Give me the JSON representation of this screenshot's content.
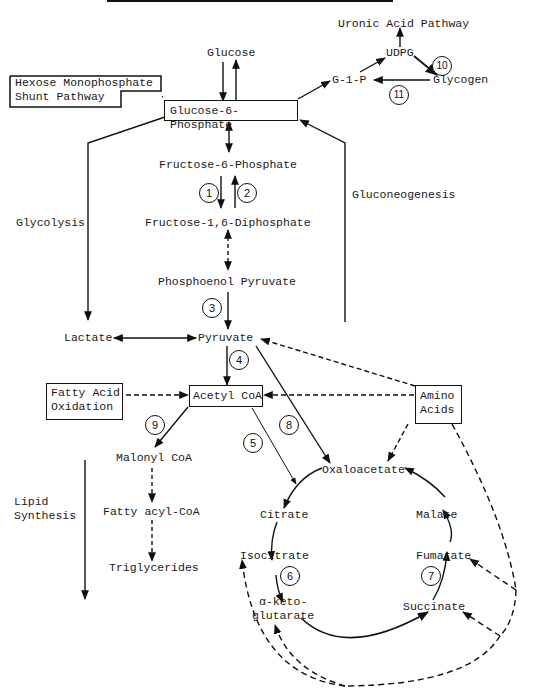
{
  "diagram": {
    "type": "metabolic-pathway",
    "colors": {
      "ink": "#111111",
      "background": "#ffffff"
    },
    "nodes": {
      "uronic_acid_pathway": "Uronic Acid Pathway",
      "glucose": "Glucose",
      "udpg": "UDPG",
      "g1p": "G-1-P",
      "glycogen": "Glycogen",
      "hmp_shunt_line1": "Hexose Monophosphate",
      "hmp_shunt_line2": "Shunt Pathway",
      "glucose_6_phosphate": "Glucose-6-Phosphate",
      "fructose_6_phosphate": "Fructose-6-Phosphate",
      "fructose_16_diphosphate": "Fructose-1,6-Diphosphate",
      "phosphoenol_pyruvate": "Phosphoenol Pyruvate",
      "lactate": "Lactate",
      "pyruvate": "Pyruvate",
      "fatty_acid_oxidation_line1": "Fatty Acid",
      "fatty_acid_oxidation_line2": "Oxidation",
      "acetyl_coa": "Acetyl CoA",
      "amino_acids_line1": "Amino",
      "amino_acids_line2": "Acids",
      "malonyl_coa": "Malonyl CoA",
      "fatty_acyl_coa": "Fatty acyl-CoA",
      "triglycerides": "Triglycerides",
      "oxaloacetate": "Oxaloacetate",
      "citrate": "Citrate",
      "isocitrate": "Isocitrate",
      "alpha_ketoglutarate_line1": "α-keto-",
      "alpha_ketoglutarate_line2": "glutarate",
      "succinate": "Succinate",
      "fumarate": "Fumarate",
      "malate": "Malate"
    },
    "pathway_labels": {
      "glycolysis": "Glycolysis",
      "gluconeogenesis": "Gluconeogenesis",
      "lipid_synthesis_line1": "Lipid",
      "lipid_synthesis_line2": "Synthesis"
    },
    "step_numbers": [
      "1",
      "2",
      "3",
      "4",
      "5",
      "6",
      "7",
      "8",
      "9",
      "10",
      "11"
    ],
    "edges": [
      {
        "from": "Glucose",
        "to": "Glucose-6-Phosphate",
        "style": "solid"
      },
      {
        "from": "Glucose-6-Phosphate",
        "to": "Glucose",
        "style": "solid"
      },
      {
        "from": "Glucose-6-Phosphate",
        "to": "Hexose Monophosphate Shunt Pathway",
        "style": "solid"
      },
      {
        "from": "Glucose-6-Phosphate",
        "to": "G-1-P",
        "style": "solid"
      },
      {
        "from": "G-1-P",
        "to": "UDPG",
        "style": "solid"
      },
      {
        "from": "UDPG",
        "to": "Uronic Acid Pathway",
        "style": "solid"
      },
      {
        "from": "UDPG",
        "to": "Glycogen",
        "style": "solid",
        "step": "10"
      },
      {
        "from": "Glycogen",
        "to": "G-1-P",
        "style": "solid",
        "step": "11"
      },
      {
        "from": "Glucose-6-Phosphate",
        "to": "Fructose-6-Phosphate",
        "style": "solid-bidirectional"
      },
      {
        "from": "Fructose-6-Phosphate",
        "to": "Fructose-1,6-Diphosphate",
        "style": "solid",
        "step": "1"
      },
      {
        "from": "Fructose-1,6-Diphosphate",
        "to": "Fructose-6-Phosphate",
        "style": "solid",
        "step": "2"
      },
      {
        "from": "Fructose-1,6-Diphosphate",
        "to": "Phosphoenol Pyruvate",
        "style": "dashed-bidirectional"
      },
      {
        "from": "Phosphoenol Pyruvate",
        "to": "Pyruvate",
        "style": "solid",
        "step": "3"
      },
      {
        "from": "Lactate",
        "to": "Pyruvate",
        "style": "solid-bidirectional"
      },
      {
        "from": "Pyruvate",
        "to": "Acetyl CoA",
        "style": "solid",
        "step": "4"
      },
      {
        "from": "Pyruvate",
        "to": "Oxaloacetate",
        "style": "solid",
        "step": "8"
      },
      {
        "from": "Fatty Acid Oxidation",
        "to": "Acetyl CoA",
        "style": "dashed"
      },
      {
        "from": "Amino Acids",
        "to": "Acetyl CoA",
        "style": "dashed"
      },
      {
        "from": "Amino Acids",
        "to": "Pyruvate",
        "style": "dashed"
      },
      {
        "from": "Amino Acids",
        "to": "Oxaloacetate",
        "style": "dashed"
      },
      {
        "from": "Acetyl CoA",
        "to": "Malonyl CoA",
        "style": "solid",
        "step": "9"
      },
      {
        "from": "Acetyl CoA",
        "to": "Citrate",
        "style": "solid",
        "step": "5"
      },
      {
        "from": "Malonyl CoA",
        "to": "Fatty acyl-CoA",
        "style": "dashed"
      },
      {
        "from": "Fatty acyl-CoA",
        "to": "Triglycerides",
        "style": "dashed"
      },
      {
        "from": "Oxaloacetate",
        "to": "Citrate",
        "style": "solid"
      },
      {
        "from": "Citrate",
        "to": "Isocitrate",
        "style": "solid"
      },
      {
        "from": "Isocitrate",
        "to": "α-ketoglutarate",
        "style": "solid",
        "step": "6"
      },
      {
        "from": "α-ketoglutarate",
        "to": "Succinate",
        "style": "solid"
      },
      {
        "from": "Succinate",
        "to": "Fumarate",
        "style": "solid",
        "step": "7"
      },
      {
        "from": "Fumarate",
        "to": "Malate",
        "style": "solid"
      },
      {
        "from": "Malate",
        "to": "Oxaloacetate",
        "style": "solid"
      },
      {
        "from": "Amino Acids",
        "to": "Fumarate",
        "style": "dashed"
      },
      {
        "from": "Amino Acids",
        "to": "Succinate",
        "style": "dashed"
      },
      {
        "from": "Amino Acids",
        "to": "α-ketoglutarate",
        "style": "dashed"
      },
      {
        "from": "Amino Acids",
        "to": "Isocitrate",
        "style": "dashed"
      },
      {
        "from": "Glucose-6-Phosphate",
        "to": "Lactate",
        "style": "solid",
        "label": "Glycolysis"
      },
      {
        "from": "Pyruvate",
        "to": "Glucose-6-Phosphate",
        "style": "solid",
        "label": "Gluconeogenesis"
      }
    ]
  }
}
